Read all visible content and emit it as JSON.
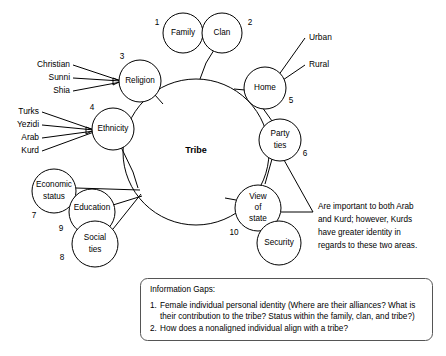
{
  "diagram": {
    "hub": {
      "label": "Tribe"
    },
    "nodes": [
      {
        "id": "family",
        "label": "Family",
        "number": "1"
      },
      {
        "id": "clan",
        "label": "Clan",
        "number": "2"
      },
      {
        "id": "religion",
        "label": "Religion",
        "number": "3"
      },
      {
        "id": "ethnicity",
        "label": "Ethnicity",
        "number": "4"
      },
      {
        "id": "home",
        "label": "Home",
        "number": "5"
      },
      {
        "id": "party-ties",
        "label_line1": "Party",
        "label_line2": "ties",
        "number": "6"
      },
      {
        "id": "economic-status",
        "label_line1": "Economic",
        "label_line2": "status",
        "number": "7"
      },
      {
        "id": "social-ties",
        "label_line1": "Social",
        "label_line2": "ties",
        "number": "8"
      },
      {
        "id": "education",
        "label": "Education",
        "number": "9"
      },
      {
        "id": "view-of-state",
        "label_line1": "View",
        "label_line2": "of",
        "label_line3": "state",
        "number": "10"
      },
      {
        "id": "security",
        "label": "Security",
        "number": ""
      }
    ],
    "religion_branches": [
      "Christian",
      "Sunni",
      "Shia"
    ],
    "ethnicity_branches": [
      "Turks",
      "Yezidi",
      "Arab",
      "Kurd"
    ],
    "home_branches": [
      "Urban",
      "Rural"
    ],
    "annotation": {
      "lines": [
        "Are important to both Arab",
        "and Kurd; however, Kurds",
        "have greater identity in",
        "regards to these two areas."
      ]
    },
    "info_gaps": {
      "title": "Information Gaps:",
      "items": [
        {
          "number": "1.",
          "lines": [
            "Female individual personal identity (Where are their alliances? What is",
            "their contribution to the tribe? Status within the family, clan, and tribe?)"
          ]
        },
        {
          "number": "2.",
          "lines": [
            "How does a nonaligned individual align with a tribe?"
          ]
        }
      ]
    },
    "colors": {
      "stroke": "#000000",
      "box_stroke": "#555555",
      "background": "#ffffff"
    }
  }
}
